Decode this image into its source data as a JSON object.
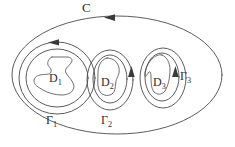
{
  "figure": {
    "type": "math-contour-diagram",
    "background_color": "#ffffff",
    "stroke_color": "#4a4a4a",
    "label_color": "#2e2e2e"
  },
  "labels": {
    "outer_contour": "C",
    "domain_1": "D",
    "domain_1_sub": "1",
    "domain_2": "D",
    "domain_2_sub": "2",
    "domain_3": "D",
    "domain_3_sub": "3",
    "gamma_1": "Γ",
    "gamma_1_sub": "1",
    "gamma_2": "Γ",
    "gamma_2_sub": "2",
    "gamma_3": "Γ",
    "gamma_3_sub": "3"
  },
  "contours": [
    {
      "name": "C",
      "shape": "ellipse",
      "cx": 117,
      "cy": 75,
      "rx": 105,
      "ry": 59,
      "orientation": "leftward-at-top"
    },
    {
      "name": "Γ1",
      "shape": "ellipse",
      "cx": 57,
      "cy": 78,
      "rx": 38,
      "ry": 36,
      "orientation": "leftward-at-top"
    },
    {
      "name": "Γ2",
      "shape": "ellipse",
      "cx": 110,
      "cy": 80,
      "rx": 23,
      "ry": 30,
      "orientation": "upward-at-right"
    },
    {
      "name": "Γ3",
      "shape": "ellipse",
      "cx": 163,
      "cy": 78,
      "rx": 23,
      "ry": 30,
      "orientation": "upward-at-right"
    }
  ],
  "arrowheads": [
    {
      "name": "arrow-on-C",
      "x": 111,
      "y": 17,
      "direction": "left"
    },
    {
      "name": "arrow-on-gamma-1",
      "x": 55,
      "y": 42,
      "direction": "left"
    },
    {
      "name": "arrow-on-gamma-2",
      "x": 131,
      "y": 74,
      "direction": "up"
    },
    {
      "name": "arrow-on-gamma-3",
      "x": 175,
      "y": 74,
      "direction": "up"
    }
  ],
  "domains": [
    {
      "name": "D1",
      "shape": "irregular-blob-with-notch"
    },
    {
      "name": "D2",
      "shape": "irregular-bean-blob"
    },
    {
      "name": "D3",
      "shape": "irregular-peaked-blob"
    }
  ]
}
